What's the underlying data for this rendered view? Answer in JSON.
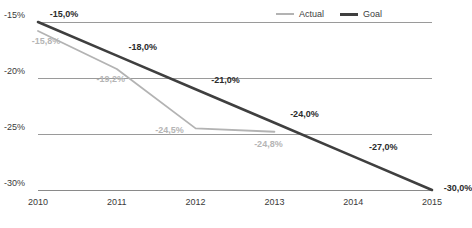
{
  "chart_data": {
    "type": "line",
    "title": "",
    "subtitle": "",
    "xlabel": "",
    "ylabel": "",
    "categories": [
      "2010",
      "2011",
      "2012",
      "2013",
      "2014",
      "2015"
    ],
    "x": [
      2010,
      2011,
      2012,
      2013,
      2014,
      2015
    ],
    "xlim": [
      2010,
      2015
    ],
    "ylim": [
      -30,
      -15
    ],
    "y_axis_inverted": true,
    "grid": true,
    "gridlines": [
      -15,
      -20,
      -25,
      -30
    ],
    "ytick_labels": [
      "-15%",
      "-20%",
      "-25%",
      "-30%"
    ],
    "ytick_values": [
      -15,
      -20,
      -25,
      -30
    ],
    "legend_position": "top-right",
    "series": [
      {
        "name": "Actual",
        "color": "#b3b3b3",
        "x": [
          2010,
          2011,
          2012,
          2013
        ],
        "values": [
          -15.8,
          -19.2,
          -24.5,
          -24.8
        ],
        "data_labels": [
          "-15,8%",
          "-19,2%",
          "-24,5%",
          "-24,8%"
        ]
      },
      {
        "name": "Goal",
        "color": "#3f3f3f",
        "x": [
          2010,
          2011,
          2012,
          2013,
          2014,
          2015
        ],
        "values": [
          -15.0,
          -18.0,
          -21.0,
          -24.0,
          -27.0,
          -30.0
        ],
        "data_labels": [
          "-15,0%",
          "-18,0%",
          "-21,0%",
          "-24,0%",
          "-27,0%",
          "-30,0%"
        ]
      }
    ],
    "annotations": [
      {
        "series": "Goal",
        "text": "-15,0%",
        "x": 2010,
        "y": -15.0
      },
      {
        "series": "Goal",
        "text": "-18,0%",
        "x": 2011,
        "y": -18.0
      },
      {
        "series": "Goal",
        "text": "-21,0%",
        "x": 2012,
        "y": -21.0
      },
      {
        "series": "Goal",
        "text": "-24,0%",
        "x": 2013,
        "y": -24.0
      },
      {
        "series": "Goal",
        "text": "-27,0%",
        "x": 2014,
        "y": -27.0
      },
      {
        "series": "Goal",
        "text": "-30,0%",
        "x": 2015,
        "y": -30.0
      },
      {
        "series": "Actual",
        "text": "-15,8%",
        "x": 2010,
        "y": -15.8
      },
      {
        "series": "Actual",
        "text": "-19,2%",
        "x": 2011,
        "y": -19.2
      },
      {
        "series": "Actual",
        "text": "-24,5%",
        "x": 2012,
        "y": -24.5
      },
      {
        "series": "Actual",
        "text": "-24,8%",
        "x": 2013,
        "y": -24.8
      }
    ]
  },
  "legend": {
    "actual_label": "Actual",
    "goal_label": "Goal"
  }
}
